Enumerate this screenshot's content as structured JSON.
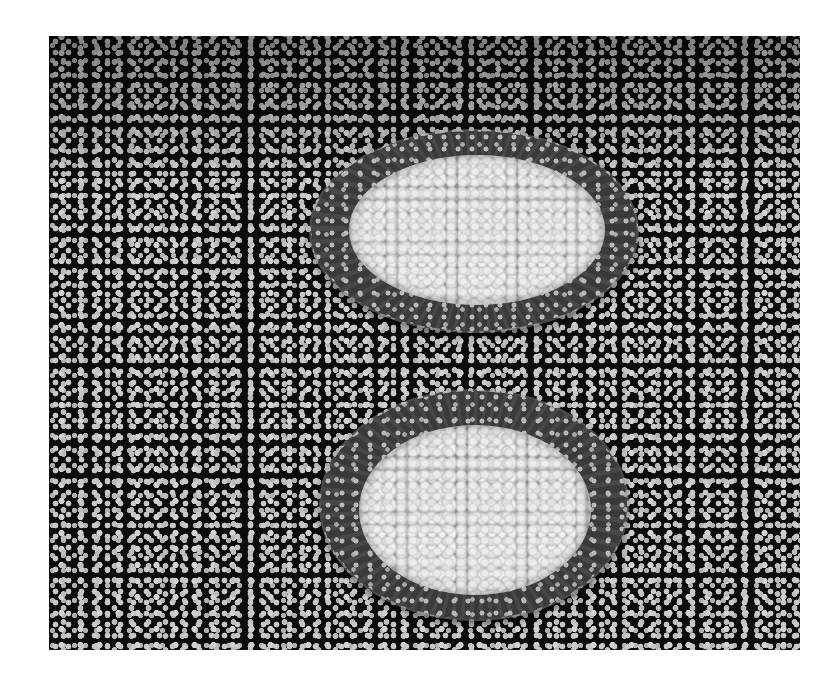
{
  "image": {
    "description": "Grayscale photograph of two glass plates filled with corn kernels, placed one behind the other on a black tablecloth with a small white flower print",
    "subjects": [
      {
        "name": "plate-top",
        "content": "corn kernels",
        "material": "clear glass plate with dotted pattern showing through"
      },
      {
        "name": "plate-bottom",
        "content": "corn kernels",
        "material": "clear glass plate with dotted pattern showing through"
      }
    ],
    "background": "black fabric with white small flower pattern",
    "colors": {
      "fabric": "#0c0c0c",
      "flowers": "#c8c8c8",
      "plate": "#3a3a3a",
      "corn": "#d6d6d6",
      "page": "#ffffff"
    }
  }
}
